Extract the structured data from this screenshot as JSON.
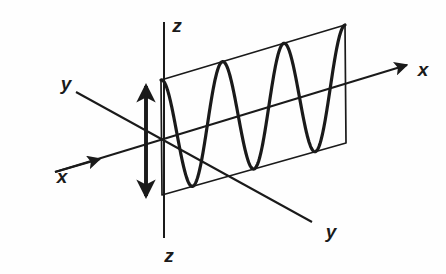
{
  "figure": {
    "background_color": "#fefefe",
    "stroke_color": "#1a1a1a",
    "canvas": {
      "width": 446,
      "height": 274
    }
  },
  "labels": {
    "x_left": "x",
    "x_right": "x",
    "y_upper_left": "y",
    "y_lower_right": "y",
    "z_top": "z",
    "z_bottom": "z"
  },
  "icons": {
    "x_axis_arrow_left": "arrowhead-icon",
    "x_axis_arrow_right": "arrowhead-icon",
    "z_arrow_up": "arrowhead-icon",
    "z_arrow_down": "arrowhead-icon"
  },
  "chart_data": {
    "type": "line",
    "xlabel": "x",
    "ylabel": "z",
    "grid": false,
    "legend": false,
    "wave": {
      "cycles": 3,
      "phase": "starts at positive maximum at the plane's left edge",
      "amplitude_normalized": 1,
      "samples_x": [
        0,
        0.125,
        0.25,
        0.375,
        0.5,
        0.625,
        0.75,
        0.875,
        1.0,
        1.125,
        1.25,
        1.375,
        1.5,
        1.625,
        1.75,
        1.875,
        2.0,
        2.125,
        2.25,
        2.375,
        2.5,
        2.625,
        2.75,
        2.875,
        3.0
      ],
      "samples_y": [
        1,
        0.707,
        0,
        -0.707,
        -1,
        -0.707,
        0,
        0.707,
        1,
        0.707,
        0,
        -0.707,
        -1,
        -0.707,
        0,
        0.707,
        1,
        0.707,
        0,
        -0.707,
        -1,
        -0.707,
        0,
        0.707,
        1
      ]
    },
    "axes": {
      "x": {
        "direction": "lower-left to upper-right",
        "arrows": [
          "mid-left",
          "far-right"
        ]
      },
      "y": {
        "direction": "upper-left to lower-right",
        "arrows": []
      },
      "z": {
        "direction": "vertical",
        "arrows": [
          "up",
          "down"
        ]
      }
    }
  }
}
